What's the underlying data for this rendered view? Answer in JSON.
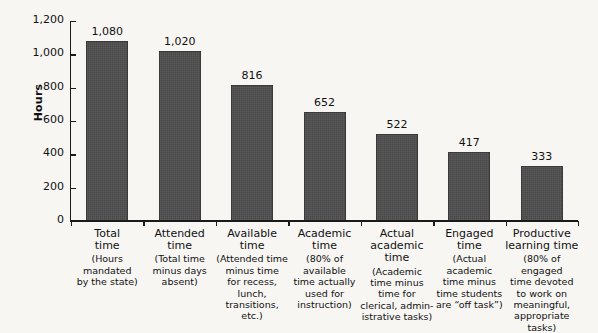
{
  "chart_data": {
    "type": "bar",
    "title": "",
    "xlabel": "",
    "ylabel": "Hours",
    "ylim": [
      0,
      1200
    ],
    "yticks": [
      0,
      200,
      400,
      600,
      800,
      1000,
      1200
    ],
    "ytick_labels": [
      "0",
      "200",
      "400",
      "600",
      "800",
      "1,000",
      "1,200"
    ],
    "grid": false,
    "legend": null,
    "bar_color": "#4c4c4c",
    "categories": [
      "Total time",
      "Attended time",
      "Available time",
      "Academic time",
      "Actual academic time",
      "Engaged time",
      "Productive learning time"
    ],
    "values": [
      1080,
      1020,
      816,
      652,
      522,
      417,
      333
    ],
    "value_labels": [
      "1,080",
      "1,020",
      "816",
      "652",
      "522",
      "417",
      "333"
    ],
    "category_details": [
      {
        "title_lines": [
          "Total",
          "time"
        ],
        "caption_lines": [
          "(Hours",
          "mandated",
          "by the state)"
        ]
      },
      {
        "title_lines": [
          "Attended",
          "time"
        ],
        "caption_lines": [
          "(Total time",
          "minus days",
          "absent)"
        ]
      },
      {
        "title_lines": [
          "Available",
          "time"
        ],
        "caption_lines": [
          "(Attended time",
          "minus time",
          "for recess, lunch,",
          "transitions, etc.)"
        ]
      },
      {
        "title_lines": [
          "Academic",
          "time"
        ],
        "caption_lines": [
          "(80% of",
          "available",
          "time actually",
          "used for",
          "instruction)"
        ]
      },
      {
        "title_lines": [
          "Actual",
          "academic time"
        ],
        "caption_lines": [
          "(Academic",
          "time minus",
          "time for",
          "clerical, admin-",
          "istrative tasks)"
        ]
      },
      {
        "title_lines": [
          "Engaged",
          "time"
        ],
        "caption_lines": [
          "(Actual",
          "academic",
          "time minus",
          "time students",
          "are “off task”)"
        ]
      },
      {
        "title_lines": [
          "Productive",
          "learning time"
        ],
        "caption_lines": [
          "(80% of engaged",
          "time devoted",
          "to work on",
          "meaningful,",
          "appropriate tasks)"
        ]
      }
    ]
  }
}
